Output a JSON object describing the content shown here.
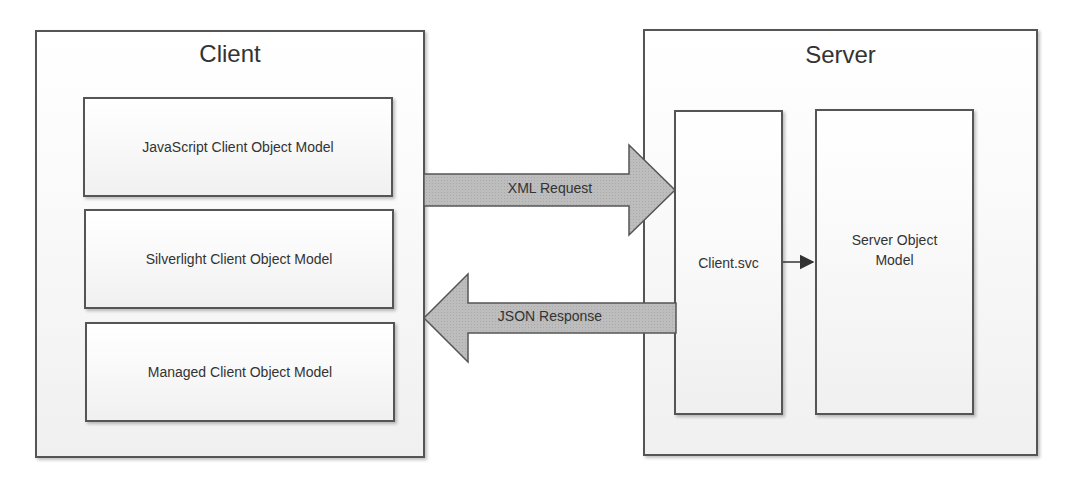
{
  "client": {
    "title": "Client",
    "components": [
      {
        "label": "JavaScript Client Object Model"
      },
      {
        "label": "Silverlight Client Object Model"
      },
      {
        "label": "Managed Client Object Model"
      }
    ]
  },
  "server": {
    "title": "Server",
    "endpoint": {
      "label": "Client.svc"
    },
    "object_model": {
      "label": "Server Object Model"
    }
  },
  "arrows": {
    "request": {
      "label": "XML Request",
      "direction": "client-to-server"
    },
    "response": {
      "label": "JSON Response",
      "direction": "server-to-client"
    },
    "internal": {
      "from": "Client.svc",
      "to": "Server Object Model"
    }
  },
  "colors": {
    "border": "#555555",
    "arrow_fill": "#b8b8b8",
    "arrow_stroke": "#555555",
    "text": "#333333"
  }
}
